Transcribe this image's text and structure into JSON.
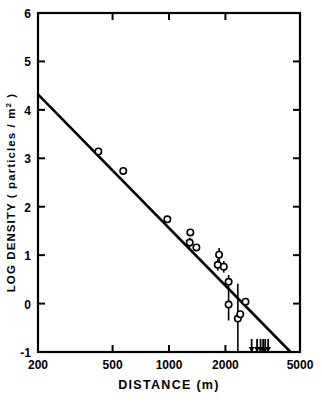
{
  "chart_data": {
    "type": "scatter",
    "title": "",
    "xlabel": "DISTANCE  (m)",
    "ylabel": "LOG DENSITY",
    "ylabel_units": "( particles / m",
    "ylabel_exponent": "2",
    "ylabel_close": " )",
    "xscale": "log",
    "yscale": "linear",
    "xlim": [
      200,
      5000
    ],
    "ylim": [
      -1,
      6
    ],
    "grid": false,
    "legend": "none",
    "xticks": [
      200,
      500,
      1000,
      2000,
      5000
    ],
    "xtick_labels": [
      "200",
      "500",
      "1000",
      "2000",
      "5000"
    ],
    "yticks": [
      -1,
      0,
      1,
      2,
      3,
      4,
      5,
      6
    ],
    "ytick_labels": [
      "-1",
      "0",
      "1",
      "2",
      "3",
      "4",
      "5",
      "6"
    ],
    "fit_line": {
      "name": "fitted power law",
      "x_start": 200,
      "y_start": 4.32,
      "x_end": 4450,
      "y_end": -1.0
    },
    "series": [
      {
        "name": "measured density",
        "marker": "open-circle",
        "points": [
          {
            "x": 420,
            "y": 3.14,
            "yerr": 0.0
          },
          {
            "x": 570,
            "y": 2.74,
            "yerr": 0.0
          },
          {
            "x": 980,
            "y": 1.74,
            "yerr": 0.0
          },
          {
            "x": 1300,
            "y": 1.47,
            "yerr": 0.0
          },
          {
            "x": 1290,
            "y": 1.26,
            "yerr": 0.1
          },
          {
            "x": 1400,
            "y": 1.16,
            "yerr": 0.0
          },
          {
            "x": 1850,
            "y": 1.01,
            "yerr": 0.14
          },
          {
            "x": 1820,
            "y": 0.8,
            "yerr": 0.12
          },
          {
            "x": 1960,
            "y": 0.76,
            "yerr": 0.12
          },
          {
            "x": 2080,
            "y": 0.45,
            "yerr": 0.14
          },
          {
            "x": 2080,
            "y": -0.02,
            "yerr": 0.33
          },
          {
            "x": 2330,
            "y": -0.31,
            "yerr": 0.72
          },
          {
            "x": 2400,
            "y": -0.22,
            "yerr": 0.0
          },
          {
            "x": 2560,
            "y": 0.04,
            "yerr": 0.0
          }
        ]
      },
      {
        "name": "upper limits",
        "marker": "down-arrow",
        "points": [
          {
            "x": 2760,
            "y": -1.0
          },
          {
            "x": 2950,
            "y": -1.0
          },
          {
            "x": 3080,
            "y": -1.0
          },
          {
            "x": 3180,
            "y": -1.0
          },
          {
            "x": 3260,
            "y": -1.0
          },
          {
            "x": 3380,
            "y": -1.0
          }
        ]
      }
    ],
    "colors": {
      "line": "#000000",
      "marker_edge": "#000000",
      "marker_face": "#ffffff",
      "axis": "#000000",
      "background": "#ffffff"
    }
  }
}
